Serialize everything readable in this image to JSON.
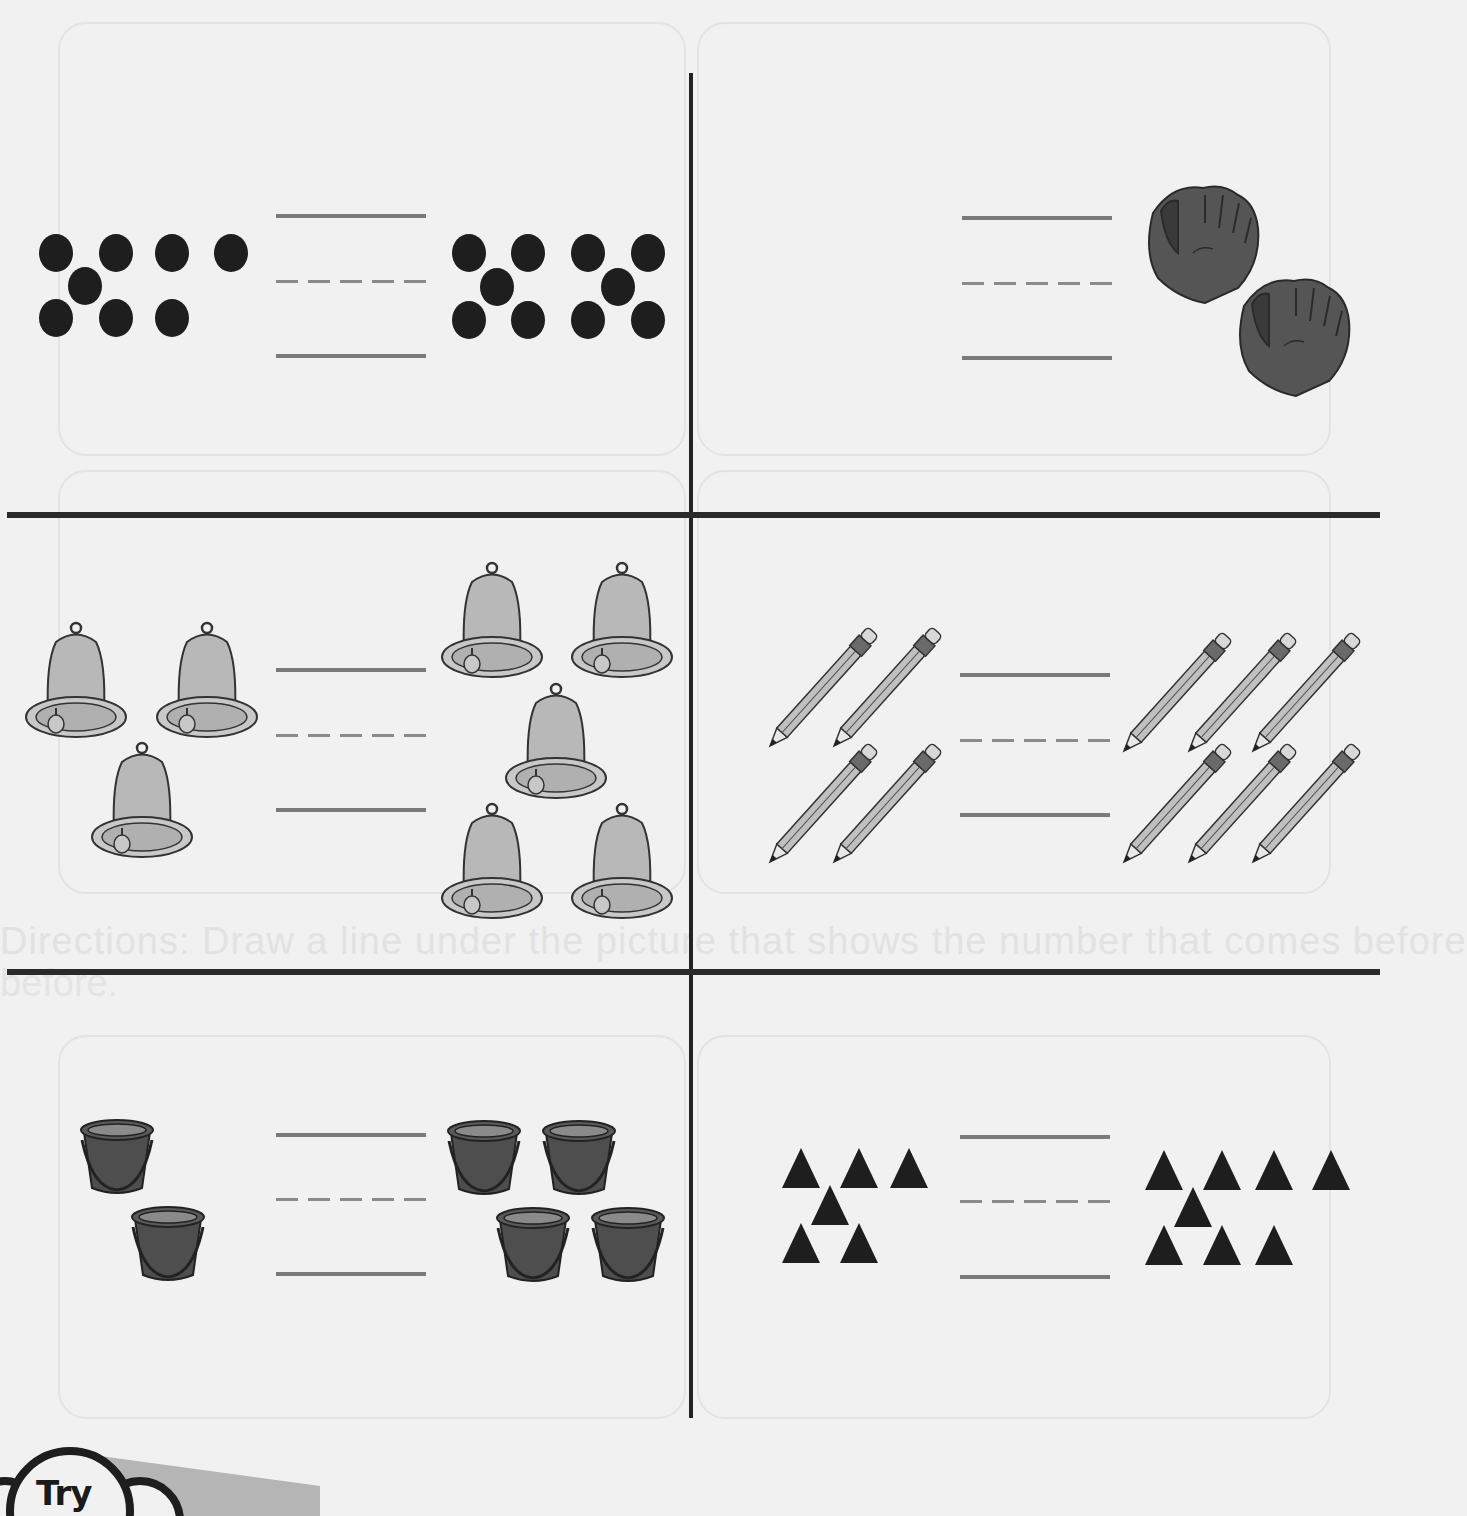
{
  "worksheet": {
    "ghost_directions": "Directions: Draw a line under the picture that shows the number that comes before",
    "ghost_directions_2": "before.",
    "try_label": "Try",
    "colors": {
      "divider": "#222222",
      "guide_line": "#7a7a7a",
      "dot": "#1e1e1e",
      "glove": "#555555",
      "bell": "#b8b8b8",
      "pencil": "#bdbdbd",
      "bucket": "#4e4e4e",
      "triangle": "#1e1e1e",
      "background": "#f1f1f1"
    }
  },
  "panels": [
    {
      "id": "dots",
      "object": "dot-icon",
      "left_count": 8,
      "right_count": 10
    },
    {
      "id": "gloves",
      "object": "glove-icon",
      "left_count": 0,
      "right_count": 2
    },
    {
      "id": "bells",
      "object": "bell-icon",
      "left_count": 3,
      "right_count": 5
    },
    {
      "id": "pencils",
      "object": "pencil-icon",
      "left_count": 4,
      "right_count": 6
    },
    {
      "id": "buckets",
      "object": "bucket-icon",
      "left_count": 2,
      "right_count": 4
    },
    {
      "id": "triangles",
      "object": "triangle-icon",
      "left_count": 6,
      "right_count": 8
    }
  ]
}
